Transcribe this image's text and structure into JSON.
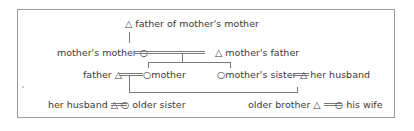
{
  "diagram": {
    "type": "kinship-chart",
    "symbols": {
      "male": "△",
      "female": "○"
    },
    "nodes": [
      {
        "id": "fmm",
        "symbol": "△",
        "label": "father of mother's mother"
      },
      {
        "id": "mm",
        "symbol": "○",
        "label": "mother's mother"
      },
      {
        "id": "mf",
        "symbol": "△",
        "label": "mother's father"
      },
      {
        "id": "f",
        "symbol": "△",
        "label": "father"
      },
      {
        "id": "m",
        "symbol": "○",
        "label": "mother"
      },
      {
        "id": "ms",
        "symbol": "○",
        "label": "mother's sister"
      },
      {
        "id": "msh",
        "symbol": "△",
        "label": "her husband"
      },
      {
        "id": "hh",
        "symbol": "△",
        "label": "her husband"
      },
      {
        "id": "os",
        "symbol": "○",
        "label": "older sister"
      },
      {
        "id": "ob",
        "symbol": "△",
        "label": "older brother"
      },
      {
        "id": "obw",
        "symbol": "○",
        "label": "his wife"
      }
    ],
    "labels": {
      "fmm": "△ father of mother's mother",
      "mm": "mother's mother ○",
      "mf": "△  mother's father",
      "f": "father △",
      "m": "○mother",
      "ms": "○mother's sister",
      "msh": "△ her husband",
      "hh": "her husband △",
      "os": "○ older sister",
      "ob": "older brother △",
      "obw": "○ his wife"
    }
  }
}
